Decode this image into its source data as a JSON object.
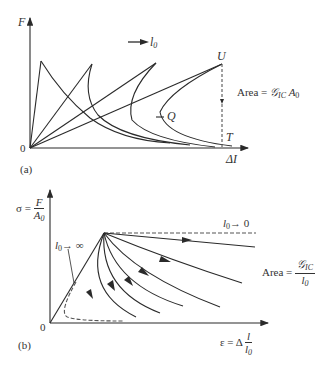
{
  "panel_a": {
    "label": "(a)",
    "y_axis_label": "F",
    "x_axis_label": "ΔI",
    "origin_label": "0",
    "direction_arrow_label": "l",
    "direction_arrow_sub": "0",
    "point_U": "U",
    "point_T": "T",
    "point_Q": "Q",
    "area_label": "Area = ",
    "area_symbol": "𝒢",
    "area_sub": "IC",
    "area_suffix": " A",
    "area_suffix_sub": "0"
  },
  "panel_b": {
    "label": "(b)",
    "y_axis_label_prefix": "σ = ",
    "y_axis_frac_num": "F",
    "y_axis_frac_den": "A",
    "y_axis_frac_den_sub": "0",
    "x_axis_label_prefix": "ε = Δ ",
    "x_axis_frac_num": "l",
    "x_axis_frac_den": "l",
    "x_axis_frac_den_sub": "0",
    "origin_label": "0",
    "limit_infinity_label": "l",
    "limit_infinity_sub": "0",
    "limit_infinity_suffix": "→ ∞",
    "limit_zero_label": "l",
    "limit_zero_sub": "0",
    "limit_zero_suffix": "→ 0",
    "area_label": "Area = ",
    "area_num": "𝒢",
    "area_num_sub": "IC",
    "area_den": "l",
    "area_den_sub": "0"
  },
  "colors": {
    "stroke": "#2a2a2a",
    "text": "#333333",
    "dashed": "#555555"
  }
}
